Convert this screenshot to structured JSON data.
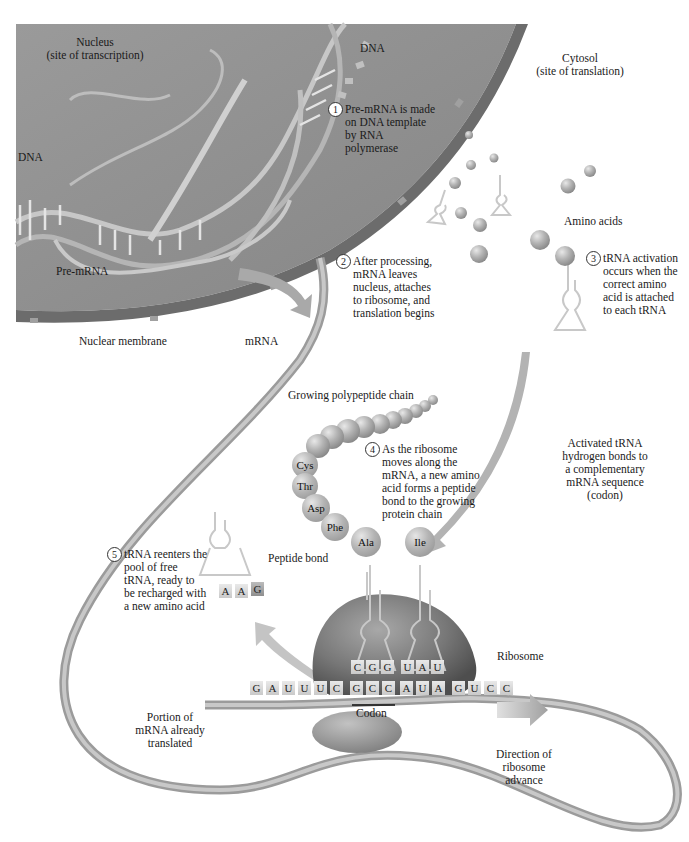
{
  "nucleus": {
    "title": "Nucleus",
    "subtitle": "(site of transcription)",
    "dna_top_label": "DNA",
    "dna_left_label": "DNA",
    "pre_mrna_label": "Pre-mRNA",
    "membrane_label": "Nuclear membrane",
    "colors": {
      "nucleoplasm": "#8f8f8f",
      "membrane": "#6e6e6e"
    },
    "template_strand_bases": [
      "A",
      "T",
      "C",
      "G",
      "T",
      "T",
      "C",
      "G",
      "C",
      "T",
      "A",
      "U"
    ],
    "coding_strand_bases": [
      "U",
      "A",
      "G",
      "C",
      "A",
      "T",
      "G",
      "C",
      "C",
      "A",
      "A",
      "G",
      "T",
      "T"
    ]
  },
  "cytosol": {
    "title": "Cytosol",
    "subtitle": "(site of translation)",
    "amino_acids_label": "Amino acids"
  },
  "mrna_label": "mRNA",
  "steps": [
    {
      "number": "1",
      "lines": [
        "Pre-mRNA is made",
        "on DNA template",
        "by RNA",
        "polymerase"
      ]
    },
    {
      "number": "2",
      "lines": [
        "After processing,",
        "mRNA leaves",
        "nucleus, attaches",
        "to ribosome, and",
        "translation begins"
      ]
    },
    {
      "number": "3",
      "lines": [
        "tRNA activation",
        "occurs when the",
        "correct amino",
        "acid is attached",
        "to each tRNA"
      ]
    },
    {
      "number": "4",
      "lines": [
        "As the ribosome",
        "moves along the",
        "mRNA, a new amino",
        "acid forms a peptide",
        "bond to the growing",
        "protein chain"
      ]
    },
    {
      "number": "5",
      "lines": [
        "tRNA reenters the",
        "pool of free",
        "tRNA, ready to",
        "be recharged with",
        "a new amino acid"
      ]
    }
  ],
  "annotations": {
    "growing_chain": "Growing polypeptide chain",
    "activated_trna": [
      "Activated tRNA",
      "hydrogen bonds to",
      "a complementary",
      "mRNA sequence",
      "(codon)"
    ],
    "peptide_bond": "Peptide bond",
    "ribosome": "Ribosome",
    "codon": "Codon",
    "already_translated": [
      "Portion of",
      "mRNA already",
      "translated"
    ],
    "direction": [
      "Direction of",
      "ribosome",
      "advance"
    ]
  },
  "polypeptide": {
    "labeled_residues": [
      "Cys",
      "Thr",
      "Asp",
      "Phe",
      "Ala"
    ],
    "incoming_residue": "Ile"
  },
  "released_trna_anticodon": [
    "A",
    "A",
    "G"
  ],
  "ribosome_anticodons": [
    "C",
    "G",
    "G",
    "U",
    "A",
    "U"
  ],
  "mrna_sequence": [
    "G",
    "A",
    "U",
    "U",
    "U",
    "C",
    "G",
    "C",
    "C",
    "A",
    "U",
    "A",
    "G",
    "U",
    "C",
    "C"
  ],
  "colors": {
    "background": "#ffffff",
    "ribbon": "#a9a9a9",
    "ribosome": "#7d7d7d",
    "amino_acid": "#b0b0b0",
    "arrow": "#b8b8b8",
    "text": "#1a1a1a"
  }
}
